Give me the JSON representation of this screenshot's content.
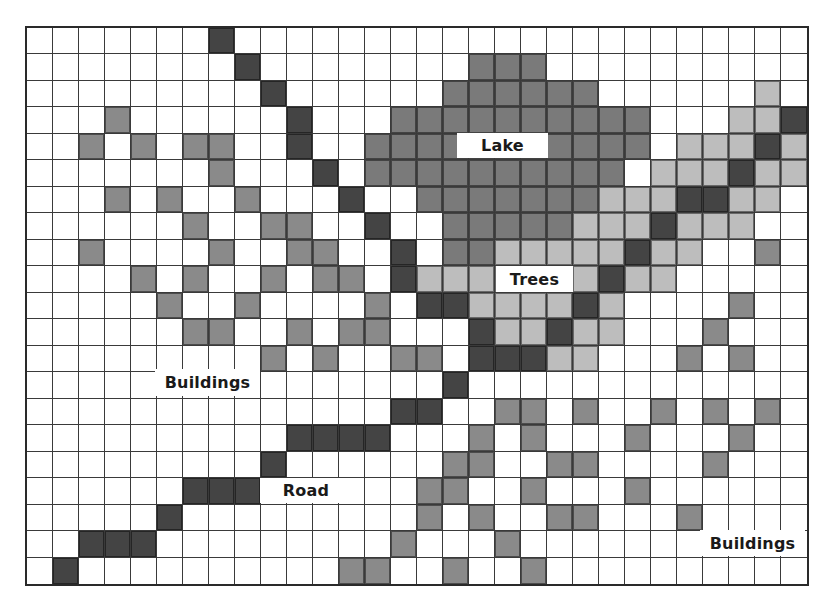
{
  "map": {
    "columns": 30,
    "rows": 21,
    "legend": {
      ".": {
        "name": "empty",
        "color": "#ffffff"
      },
      "D": {
        "name": "road",
        "color": "#444444"
      },
      "M": {
        "name": "buildings",
        "color": "#8a8a8a"
      },
      "L": {
        "name": "lake",
        "color": "#7a7a7a"
      },
      "T": {
        "name": "trees",
        "color": "#bdbdbd"
      }
    },
    "grid": [
      ".......D......................",
      "........D........LLL..........",
      ".........D......LLLLLL......T.",
      "...M......D...LLLLLLLLLL...TTD",
      "..M.M.MM..D..LLLLLLLLLLL.TTTDT",
      ".......M...D.LLLLLLLLLL.TTTDTT",
      "...M.M..M...D..LLLLLLLTTTDDTT.",
      "......M..MM..D..LLLLLTTTDTTT..",
      "..M....M..MM..D.LLTTTTTDTT..M.",
      "....M.M..M.MM.DTTTTTTTDTT.....",
      ".....M..M....M.DDTTTTDT....M..",
      "......MM..M.MM...DTTDTT...M...",
      ".........M.M..MM.DDDTT...M.M..",
      "................D.............",
      "..............DD..MM.M..M.M.M.",
      "..........DDDD...M.M...M...M..",
      ".........D......MM..MM....M...",
      "......DDD......MM..M...M......",
      ".....D.........M.M..MM...M....",
      "..DDD.........M...M...........",
      ".D..........MM..M..M.........."
    ]
  },
  "labels": {
    "lake": "Lake",
    "trees": "Trees",
    "buildings_left": "Buildings",
    "road": "Road",
    "buildings_right": "Buildings"
  }
}
